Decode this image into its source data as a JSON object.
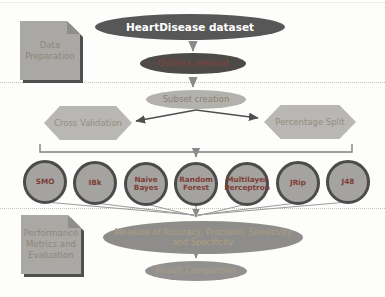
{
  "notes": {
    "data_preparation": "Data Preparation",
    "performance": "Performance Metrics and Evaluation"
  },
  "nodes": {
    "dataset": "HeartDisease dataset",
    "outliers": "Outliers removal",
    "subset": "Subset creation",
    "cross_validation": "Cross Validation",
    "percentage_split": "Percentage Split",
    "measure": "Measure of Accuracy, Precision, Sensitivity and Specificity",
    "result": "Result Comparison"
  },
  "classifiers": [
    "SMO",
    "IBk",
    "Naive Bayes",
    "Random Forest",
    "Multilayer Perceptron",
    "JRip",
    "J48"
  ],
  "colors": {
    "dataset_fill": "#575757",
    "dataset_text": "#ffffff",
    "outliers_fill": "#4e4a48",
    "outliers_text": "#86423a",
    "subset_fill": "#b3b1ad",
    "subset_text": "#8d8170",
    "hex_fill": "#b9b7b3",
    "hex_text": "#948c7e",
    "circle_fill": "#a5a3a0",
    "circle_border": "#4b4b4b",
    "circle_text": "#7f3d36",
    "measure_fill": "#8e8d8b",
    "measure_text": "#ac9f7e",
    "result_fill": "#929190",
    "result_text": "#a99d80",
    "note_fill": "#a9a8a5",
    "note_text": "#8d8779",
    "note_shadow": "#4f4f4f",
    "note_fold": "#8f8e8b",
    "dotted": "#c9c4b4"
  }
}
